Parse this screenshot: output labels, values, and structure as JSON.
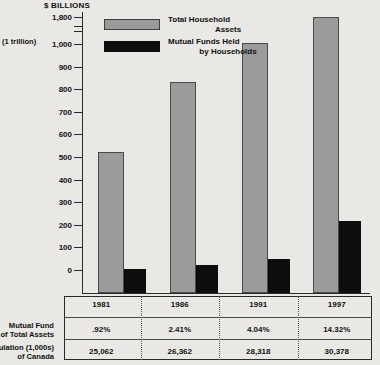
{
  "chart_data": {
    "type": "bar",
    "title": "$ BILLIONS",
    "axis_note": "(1 trillion)",
    "xlabel": "",
    "ylabel": "$ BILLIONS",
    "categories": [
      "1981",
      "1986",
      "1991",
      "1997"
    ],
    "yticks": [
      "1,800",
      "1,000",
      "900",
      "800",
      "700",
      "600",
      "500",
      "400",
      "300",
      "200",
      "100",
      "0"
    ],
    "ylim": [
      0,
      1800
    ],
    "axis_break": true,
    "axis_break_between": [
      "1,000",
      "1,800"
    ],
    "grid": false,
    "legend_position": "top-left-inside",
    "series": [
      {
        "name": "Total Household Assets",
        "name_line1": "Total Household",
        "name_line2": "Assets",
        "color": "#9b9b9b",
        "values": [
          520,
          830,
          1020,
          1790
        ]
      },
      {
        "name": "Mutual Funds Held by Households",
        "name_line1": "Mutual Funds Held",
        "name_line2": "by Households",
        "color": "#0d0d0d",
        "values": [
          5,
          20,
          50,
          215
        ]
      }
    ]
  },
  "table": {
    "rows": [
      {
        "label_line1": "Mutual Fund",
        "label_line2": "% of Total Assets",
        "values": [
          ".92%",
          "2.41%",
          "4.04%",
          "14.32%"
        ]
      },
      {
        "label_line1": "Population (1,000s)",
        "label_line2": "of Canada",
        "values": [
          "25,062",
          "26,362",
          "28,318",
          "30,378"
        ]
      }
    ]
  },
  "colors": {
    "background": "#e9e8e4",
    "total_assets": "#9b9b9b",
    "mutual_funds": "#0d0d0d",
    "axis": "#2a2a2a"
  }
}
